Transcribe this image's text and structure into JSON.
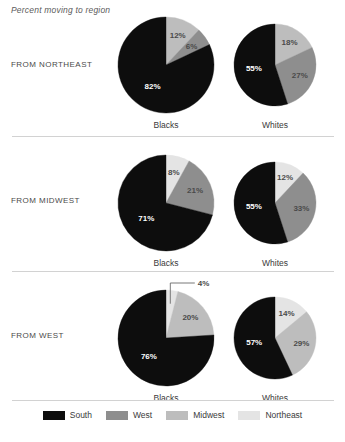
{
  "title": "Percent moving to region",
  "colors": {
    "south": "#0d0d0d",
    "west": "#8e8e8e",
    "midwest": "#bdbdbd",
    "northeast": "#e4e4e4",
    "divider": "#d2d2d2",
    "label_dark": "#4a4a4a",
    "label_light": "#ffffff"
  },
  "legend": {
    "items": [
      {
        "label": "South",
        "color": "#0d0d0d"
      },
      {
        "label": "West",
        "color": "#8e8e8e"
      },
      {
        "label": "Midwest",
        "color": "#bdbdbd"
      },
      {
        "label": "Northeast",
        "color": "#e4e4e4"
      }
    ]
  },
  "rows": [
    {
      "label": "FROM NORTHEAST",
      "charts": [
        {
          "caption": "Blacks",
          "labels": [
            "12%",
            "6%",
            "82%"
          ]
        },
        {
          "caption": "Whites",
          "labels": [
            "18%",
            "27%",
            "55%"
          ]
        }
      ]
    },
    {
      "label": "FROM MIDWEST",
      "charts": [
        {
          "caption": "Blacks",
          "labels": [
            "8%",
            "21%",
            "71%"
          ]
        },
        {
          "caption": "Whites",
          "labels": [
            "12%",
            "33%",
            "55%"
          ]
        }
      ]
    },
    {
      "label": "FROM WEST",
      "charts": [
        {
          "caption": "Blacks",
          "labels": [
            "4%",
            "20%",
            "76%"
          ]
        },
        {
          "caption": "Whites",
          "labels": [
            "14%",
            "29%",
            "57%"
          ]
        }
      ]
    }
  ],
  "chart_data": {
    "type": "pie",
    "title": "Percent moving to region",
    "subtitle": "",
    "xlabel": "",
    "ylabel": "",
    "legend_position": "bottom",
    "legend_entries": [
      "South",
      "West",
      "Midwest",
      "Northeast"
    ],
    "units": "percent",
    "panels": [
      {
        "row": "FROM NORTHEAST",
        "group": "Blacks",
        "slices": [
          {
            "name": "Midwest",
            "value": 12,
            "label": "12%",
            "color": "#bdbdbd"
          },
          {
            "name": "West",
            "value": 6,
            "label": "6%",
            "color": "#8e8e8e"
          },
          {
            "name": "South",
            "value": 82,
            "label": "82%",
            "color": "#0d0d0d"
          }
        ]
      },
      {
        "row": "FROM NORTHEAST",
        "group": "Whites",
        "slices": [
          {
            "name": "Midwest",
            "value": 18,
            "label": "18%",
            "color": "#bdbdbd"
          },
          {
            "name": "West",
            "value": 27,
            "label": "27%",
            "color": "#8e8e8e"
          },
          {
            "name": "South",
            "value": 55,
            "label": "55%",
            "color": "#0d0d0d"
          }
        ]
      },
      {
        "row": "FROM MIDWEST",
        "group": "Blacks",
        "slices": [
          {
            "name": "Northeast",
            "value": 8,
            "label": "8%",
            "color": "#e4e4e4"
          },
          {
            "name": "West",
            "value": 21,
            "label": "21%",
            "color": "#8e8e8e"
          },
          {
            "name": "South",
            "value": 71,
            "label": "71%",
            "color": "#0d0d0d"
          }
        ]
      },
      {
        "row": "FROM MIDWEST",
        "group": "Whites",
        "slices": [
          {
            "name": "Northeast",
            "value": 12,
            "label": "12%",
            "color": "#e4e4e4"
          },
          {
            "name": "West",
            "value": 33,
            "label": "33%",
            "color": "#8e8e8e"
          },
          {
            "name": "South",
            "value": 55,
            "label": "55%",
            "color": "#0d0d0d"
          }
        ]
      },
      {
        "row": "FROM WEST",
        "group": "Blacks",
        "slices": [
          {
            "name": "Northeast",
            "value": 4,
            "label": "4%",
            "color": "#e4e4e4"
          },
          {
            "name": "Midwest",
            "value": 20,
            "label": "20%",
            "color": "#bdbdbd"
          },
          {
            "name": "South",
            "value": 76,
            "label": "76%",
            "color": "#0d0d0d"
          }
        ]
      },
      {
        "row": "FROM WEST",
        "group": "Whites",
        "slices": [
          {
            "name": "Northeast",
            "value": 14,
            "label": "14%",
            "color": "#e4e4e4"
          },
          {
            "name": "Midwest",
            "value": 29,
            "label": "29%",
            "color": "#bdbdbd"
          },
          {
            "name": "South",
            "value": 57,
            "label": "57%",
            "color": "#0d0d0d"
          }
        ]
      }
    ]
  }
}
